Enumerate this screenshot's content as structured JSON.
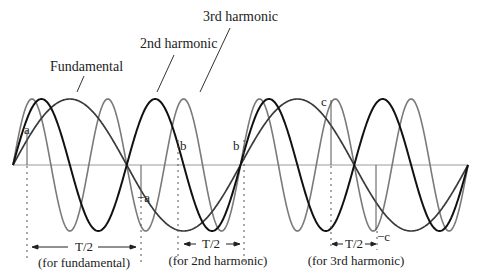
{
  "labels": {
    "third_harmonic": "3rd harmonic",
    "second_harmonic": "2nd harmonic",
    "fundamental": "Fundamental"
  },
  "points": {
    "a": "a",
    "neg_a": "−a",
    "b1": "b",
    "b2": "b",
    "c": "c",
    "neg_c": "−c"
  },
  "periods": [
    {
      "label": "T/2",
      "sub": "(for fundamental)"
    },
    {
      "label": "T/2",
      "sub": "(for 2nd harmonic)"
    },
    {
      "label": "T/2",
      "sub": "(for 3rd harmonic)"
    }
  ],
  "colors": {
    "fundamental": "#3a3a3a",
    "second": "#111111",
    "third": "#7a7a7a",
    "axis": "#9a9a9a"
  },
  "geometry": {
    "axis_y": 165,
    "x_start": 13,
    "x_end": 468,
    "amplitude": 66,
    "fundamental_cycles": 2,
    "second_cycles": 4,
    "third_cycles": 6
  }
}
